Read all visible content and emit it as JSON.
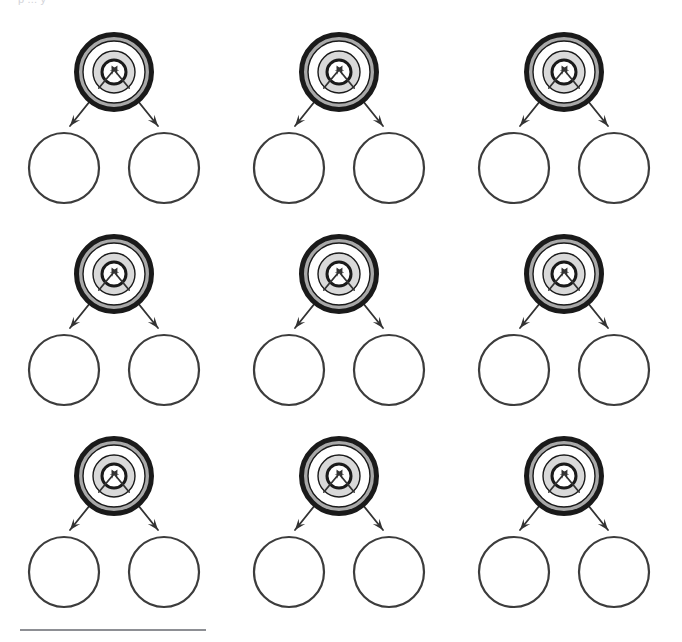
{
  "page": {
    "width": 682,
    "height": 642,
    "background": "#ffffff",
    "top_clipped_text": "p ... y",
    "footer_rule_color": "#8d8f94"
  },
  "diagram": {
    "type": "target-with-two-outcome-circles",
    "title": "",
    "repeat_count": 9,
    "grid": {
      "rows": 3,
      "columns": 3,
      "column_step": 225,
      "row_step": 202,
      "origin_x": 18,
      "origin_y": 20
    },
    "colors": {
      "outline": "#1a1a1a",
      "ring_outer": "#a9a9a9",
      "ring_middle": "#ffffff",
      "ring_inner": "#d9d9d9",
      "bullseye_fill": "#ffffff",
      "circle_stroke": "#3c3c3c",
      "arrow": "#333333"
    },
    "target": {
      "label": "",
      "center_x": 96,
      "center_y": 52,
      "radii": {
        "outer": 40,
        "ring2": 31,
        "ring3": 21,
        "bullseye": 12
      },
      "outer_stroke_width": 5,
      "arrowheads_in_center": 2
    },
    "outcome_circles": [
      {
        "label": "",
        "center_x": 46,
        "center_y": 148,
        "radius": 35
      },
      {
        "label": "",
        "center_x": 146,
        "center_y": 148,
        "radius": 35
      }
    ],
    "arrows": [
      {
        "label": "",
        "from": "target-center",
        "to": "outcome-circle-left",
        "direction": "down-left"
      },
      {
        "label": "",
        "from": "target-center",
        "to": "outcome-circle-right",
        "direction": "down-right"
      }
    ],
    "units": [
      {
        "id": "unit-1",
        "row": 1,
        "col": 1
      },
      {
        "id": "unit-2",
        "row": 1,
        "col": 2
      },
      {
        "id": "unit-3",
        "row": 1,
        "col": 3
      },
      {
        "id": "unit-4",
        "row": 2,
        "col": 1
      },
      {
        "id": "unit-5",
        "row": 2,
        "col": 2
      },
      {
        "id": "unit-6",
        "row": 2,
        "col": 3
      },
      {
        "id": "unit-7",
        "row": 3,
        "col": 1
      },
      {
        "id": "unit-8",
        "row": 3,
        "col": 2
      },
      {
        "id": "unit-9",
        "row": 3,
        "col": 3
      }
    ]
  }
}
